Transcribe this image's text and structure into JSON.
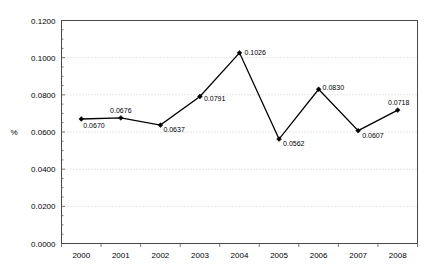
{
  "chart_data": {
    "type": "line",
    "title": "",
    "xlabel": "",
    "ylabel": "%",
    "categories": [
      "2000",
      "2001",
      "2002",
      "2003",
      "2004",
      "2005",
      "2006",
      "2007",
      "2008"
    ],
    "values": [
      0.067,
      0.0676,
      0.0637,
      0.0791,
      0.1026,
      0.0562,
      0.083,
      0.0607,
      0.0718
    ],
    "point_labels": [
      "0.0670",
      "0.0676",
      "0.0637",
      "0.0791",
      "0.1026",
      "0.0562",
      "0.0830",
      "0.0607",
      "0.0718"
    ],
    "ylim": [
      0.0,
      0.12
    ],
    "ytick_values": [
      0.0,
      0.02,
      0.04,
      0.06,
      0.08,
      0.1,
      0.12
    ],
    "ytick_labels": [
      "0.0000",
      "0.0200",
      "0.0400",
      "0.0600",
      "0.0800",
      "0.1000",
      "0.1200"
    ],
    "grid": true,
    "grid_style": "dotted-horizontal",
    "legend": "none",
    "marker": "filled-diamond",
    "line_color": "#000000",
    "grid_color": "#b9b9c9",
    "axis_color": "#4a4a4a"
  }
}
